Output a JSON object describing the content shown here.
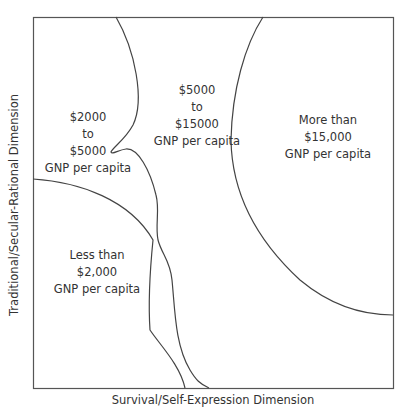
{
  "diagram": {
    "x_axis_label": "Survival/Self-Expression Dimension",
    "y_axis_label": "Traditional/Secular-Rational Dimension",
    "line_color": "#444444",
    "regions": [
      {
        "id": "low",
        "lines": [
          "Less than",
          "$2,000",
          "GNP per capita"
        ]
      },
      {
        "id": "lower-middle",
        "lines": [
          "$2000",
          "to",
          "$5000",
          "GNP per capita"
        ]
      },
      {
        "id": "upper-middle",
        "lines": [
          "$5000",
          "to",
          "$15000",
          "GNP per capita"
        ]
      },
      {
        "id": "high",
        "lines": [
          "More than",
          "$15,000",
          "GNP per capita"
        ]
      }
    ]
  }
}
